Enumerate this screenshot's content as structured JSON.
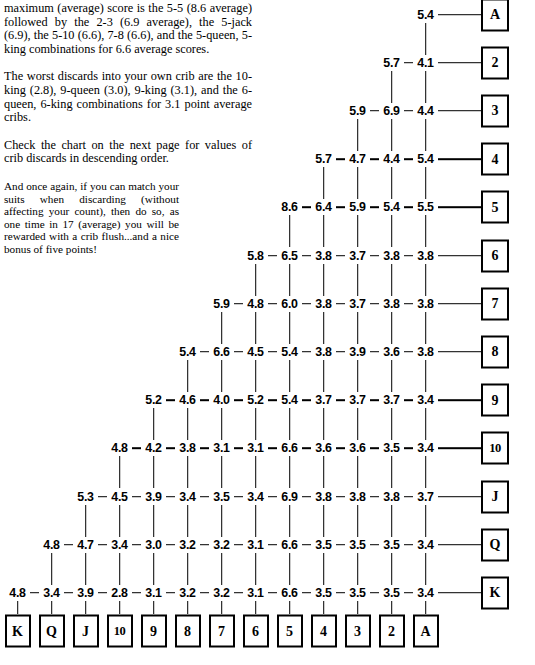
{
  "article": {
    "paragraphs": [
      "maximum (average) score is the 5-5 (8.6 average) followed by the 2-3 (6.9 average), the 5-jack (6.9), the 5-10 (6.6), 7-8 (6.6), and the 5-queen, 5-king combinations for 6.6 average scores.",
      "The worst discards into your own crib are the 10-king (2.8), 9-queen (3.0), 9-king (3.1), and the 6-queen, 6-king combinations for 3.1 point average cribs.",
      "Check the chart on the next page for values of crib discards in descending order.",
      "And once again, if you can match your suits when discarding (without affecting your count), then do so, as one time in 17 (average) you will be rewarded with a crib flush...and a nice bonus of five points!"
    ]
  },
  "chart_data": {
    "type": "table",
    "title": "",
    "xlabel": "",
    "ylabel": "",
    "columns": [
      "K",
      "Q",
      "J",
      "10",
      "9",
      "8",
      "7",
      "6",
      "5",
      "4",
      "3",
      "2",
      "A"
    ],
    "rows": [
      "A",
      "2",
      "3",
      "4",
      "5",
      "6",
      "7",
      "8",
      "9",
      "10",
      "J",
      "Q",
      "K"
    ],
    "triangle": [
      {
        "row_label": "A",
        "values": [
          "5.4"
        ]
      },
      {
        "row_label": "2",
        "values": [
          "5.7",
          "4.1"
        ]
      },
      {
        "row_label": "3",
        "values": [
          "5.9",
          "6.9",
          "4.4"
        ]
      },
      {
        "row_label": "4",
        "values": [
          "5.7",
          "4.7",
          "4.4",
          "5.4"
        ]
      },
      {
        "row_label": "5",
        "values": [
          "8.6",
          "6.4",
          "5.9",
          "5.4",
          "5.5"
        ]
      },
      {
        "row_label": "6",
        "values": [
          "5.8",
          "6.5",
          "3.8",
          "3.7",
          "3.8",
          "3.8"
        ]
      },
      {
        "row_label": "7",
        "values": [
          "5.9",
          "4.8",
          "6.0",
          "3.8",
          "3.7",
          "3.8",
          "3.8"
        ]
      },
      {
        "row_label": "8",
        "values": [
          "5.4",
          "6.6",
          "4.5",
          "5.4",
          "3.8",
          "3.9",
          "3.6",
          "3.8"
        ]
      },
      {
        "row_label": "9",
        "values": [
          "5.2",
          "4.6",
          "4.0",
          "5.2",
          "5.4",
          "3.7",
          "3.7",
          "3.7",
          "3.4"
        ]
      },
      {
        "row_label": "10",
        "values": [
          "4.8",
          "4.2",
          "3.8",
          "3.1",
          "3.1",
          "6.6",
          "3.6",
          "3.6",
          "3.5",
          "3.4"
        ]
      },
      {
        "row_label": "J",
        "values": [
          "5.3",
          "4.5",
          "3.9",
          "3.4",
          "3.5",
          "3.4",
          "6.9",
          "3.8",
          "3.8",
          "3.8",
          "3.7"
        ]
      },
      {
        "row_label": "Q",
        "values": [
          "4.8",
          "4.7",
          "3.4",
          "3.0",
          "3.2",
          "3.2",
          "3.1",
          "6.6",
          "3.5",
          "3.5",
          "3.5",
          "3.4"
        ]
      },
      {
        "row_label": "K",
        "values": [
          "4.8",
          "3.4",
          "3.9",
          "2.8",
          "3.1",
          "3.2",
          "3.2",
          "3.1",
          "6.6",
          "3.5",
          "3.5",
          "3.5",
          "3.4"
        ]
      }
    ]
  },
  "colors": {
    "ink": "#000000",
    "page": "#ffffff"
  }
}
